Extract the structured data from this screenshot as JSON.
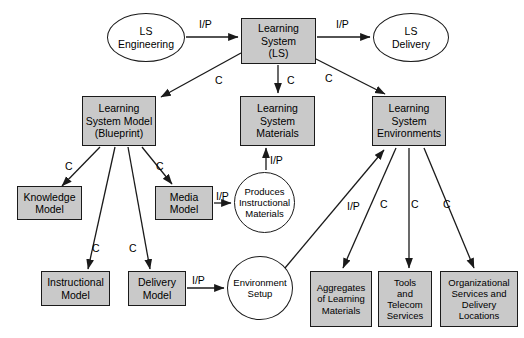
{
  "diagram": {
    "colors": {
      "node_fill": "#c9c9c9",
      "node_stroke": "#1a1a1a",
      "ellipse_fill": "#ffffff",
      "edge_stroke": "#1a1a1a",
      "background": "#ffffff"
    },
    "nodes": [
      {
        "id": "ls_engineering",
        "shape": "ellipse",
        "label": "LS\nEngineering",
        "x": 107,
        "y": 13,
        "w": 78,
        "h": 49,
        "font": 10.5
      },
      {
        "id": "learning_system",
        "shape": "box",
        "label": "Learning\nSystem\n(LS)",
        "x": 241,
        "y": 18,
        "w": 75,
        "h": 46,
        "font": 10.5
      },
      {
        "id": "ls_delivery",
        "shape": "ellipse",
        "label": "LS\nDelivery",
        "x": 373,
        "y": 13,
        "w": 76,
        "h": 49,
        "font": 10.5
      },
      {
        "id": "ls_model_blueprint",
        "shape": "box",
        "label": "Learning\nSystem Model\n(Blueprint)",
        "x": 82,
        "y": 96,
        "w": 74,
        "h": 50,
        "font": 10.5
      },
      {
        "id": "ls_materials",
        "shape": "box",
        "label": "Learning\nSystem\nMaterials",
        "x": 240,
        "y": 96,
        "w": 75,
        "h": 50,
        "font": 10.5
      },
      {
        "id": "ls_environments",
        "shape": "box",
        "label": "Learning\nSystem\nEnvironments",
        "x": 372,
        "y": 96,
        "w": 74,
        "h": 50,
        "font": 10.5
      },
      {
        "id": "knowledge_model",
        "shape": "box",
        "label": "Knowledge\nModel",
        "x": 17,
        "y": 186,
        "w": 65,
        "h": 34,
        "font": 10.5
      },
      {
        "id": "media_model",
        "shape": "box",
        "label": "Media\nModel",
        "x": 155,
        "y": 186,
        "w": 58,
        "h": 34,
        "font": 10.5
      },
      {
        "id": "produces_instructional_materials",
        "shape": "ellipse",
        "label": "Produces\nInstructional\nMaterials",
        "x": 234,
        "y": 172,
        "w": 61,
        "h": 61,
        "font": 9.5
      },
      {
        "id": "instructional_model",
        "shape": "box",
        "label": "Instructional\nModel",
        "x": 41,
        "y": 271,
        "w": 69,
        "h": 35,
        "font": 10.5
      },
      {
        "id": "delivery_model",
        "shape": "box",
        "label": "Delivery\nModel",
        "x": 128,
        "y": 271,
        "w": 58,
        "h": 35,
        "font": 10.5
      },
      {
        "id": "environment_setup",
        "shape": "ellipse",
        "label": "Environment\nSetup",
        "x": 227,
        "y": 256,
        "w": 66,
        "h": 64,
        "font": 9.5
      },
      {
        "id": "aggregates_of_learning_materials",
        "shape": "box",
        "label": "Aggregates\nof Learning\nMaterials",
        "x": 310,
        "y": 271,
        "w": 62,
        "h": 56,
        "font": 9.5
      },
      {
        "id": "tools_and_telecom_services",
        "shape": "box",
        "label": "Tools\nand\nTelecom\nServices",
        "x": 378,
        "y": 271,
        "w": 54,
        "h": 56,
        "font": 9.5
      },
      {
        "id": "organizational_services_and_delivery_locations",
        "shape": "box",
        "label": "Organizational\nServices and\nDelivery\nLocations",
        "x": 440,
        "y": 271,
        "w": 78,
        "h": 56,
        "font": 9.5
      }
    ],
    "edges": [
      {
        "id": "e1",
        "from": "ls_engineering",
        "to": "learning_system",
        "label": "I/P",
        "label_x": 199,
        "label_y": 18
      },
      {
        "id": "e2",
        "from": "learning_system",
        "to": "ls_delivery",
        "label": "I/P",
        "label_x": 336,
        "label_y": 18
      },
      {
        "id": "e3",
        "from": "learning_system",
        "to": "ls_model_blueprint",
        "label": "C",
        "label_x": 215,
        "label_y": 74
      },
      {
        "id": "e4",
        "from": "learning_system",
        "to": "ls_materials",
        "label": "C",
        "label_x": 287,
        "label_y": 74
      },
      {
        "id": "e5",
        "from": "learning_system",
        "to": "ls_environments",
        "label": "C",
        "label_x": 325,
        "label_y": 72
      },
      {
        "id": "e6",
        "from": "ls_model_blueprint",
        "to": "knowledge_model",
        "label": "C",
        "label_x": 65,
        "label_y": 160
      },
      {
        "id": "e7",
        "from": "ls_model_blueprint",
        "to": "instructional_model",
        "label": "C",
        "label_x": 92,
        "label_y": 242
      },
      {
        "id": "e8",
        "from": "ls_model_blueprint",
        "to": "delivery_model",
        "label": "C",
        "label_x": 129,
        "label_y": 242
      },
      {
        "id": "e9",
        "from": "ls_model_blueprint",
        "to": "media_model",
        "label": "C",
        "label_x": 156,
        "label_y": 160
      },
      {
        "id": "e10",
        "from": "media_model",
        "to": "produces_instructional_materials",
        "label": "I/P",
        "label_x": 216,
        "label_y": 190
      },
      {
        "id": "e11",
        "from": "produces_instructional_materials",
        "to": "ls_materials",
        "label": "I/P",
        "label_x": 270,
        "label_y": 154
      },
      {
        "id": "e12",
        "from": "delivery_model",
        "to": "environment_setup",
        "label": "I/P",
        "label_x": 192,
        "label_y": 274
      },
      {
        "id": "e13",
        "from": "environment_setup",
        "to": "ls_environments",
        "label": "I/P",
        "label_x": 347,
        "label_y": 200
      },
      {
        "id": "e14",
        "from": "ls_environments",
        "to": "aggregates_of_learning_materials",
        "label": "C",
        "label_x": 380,
        "label_y": 198
      },
      {
        "id": "e15",
        "from": "ls_environments",
        "to": "tools_and_telecom_services",
        "label": "C",
        "label_x": 411,
        "label_y": 198
      },
      {
        "id": "e16",
        "from": "ls_environments",
        "to": "organizational_services_and_delivery_locations",
        "label": "C",
        "label_x": 443,
        "label_y": 198
      }
    ],
    "edge_paths": [
      {
        "id": "e1",
        "d": "M 186 37 L 238 37"
      },
      {
        "id": "e2",
        "d": "M 317 37 L 370 37"
      },
      {
        "id": "e3",
        "d": "M 241 53 L 161 97"
      },
      {
        "id": "e4",
        "d": "M 278 65 L 278 93"
      },
      {
        "id": "e5",
        "d": "M 314 58 L 385 94"
      },
      {
        "id": "e6",
        "d": "M 100 147 L 62 186"
      },
      {
        "id": "e7",
        "d": "M 115 147 L 88 269"
      },
      {
        "id": "e8",
        "d": "M 128 147 L 150 269"
      },
      {
        "id": "e9",
        "d": "M 142 147 L 172 184"
      },
      {
        "id": "e10",
        "d": "M 214 203 L 231 203"
      },
      {
        "id": "e11",
        "d": "M 266 170 L 266 148"
      },
      {
        "id": "e12",
        "d": "M 187 288 L 224 288"
      },
      {
        "id": "e13",
        "d": "M 285 268 L 384 150"
      },
      {
        "id": "e14",
        "d": "M 396 148 L 343 268"
      },
      {
        "id": "e15",
        "d": "M 409 148 L 409 268"
      },
      {
        "id": "e16",
        "d": "M 424 148 L 474 268"
      }
    ]
  }
}
